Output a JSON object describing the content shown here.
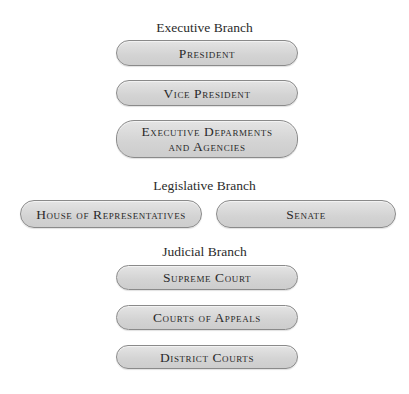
{
  "diagram": {
    "type": "org-chart",
    "clipped_title_visible": true,
    "branches": [
      {
        "heading": "Executive Branch",
        "nodes": [
          {
            "label": "President"
          },
          {
            "label": "Vice President"
          },
          {
            "label_lines": [
              "Executive Deparments",
              "and Agencies"
            ]
          }
        ]
      },
      {
        "heading": "Legislative Branch",
        "nodes": [
          {
            "label": "House of Representatives"
          },
          {
            "label": "Senate"
          }
        ]
      },
      {
        "heading": "Judicial Branch",
        "nodes": [
          {
            "label": "Supreme Court"
          },
          {
            "label": "Courts of Appeals"
          },
          {
            "label": "District Courts"
          }
        ]
      }
    ]
  },
  "colors": {
    "box_fill": "#d6d6d6",
    "box_border": "#8a8a8a",
    "text": "#2a2a2a",
    "background": "#ffffff"
  }
}
